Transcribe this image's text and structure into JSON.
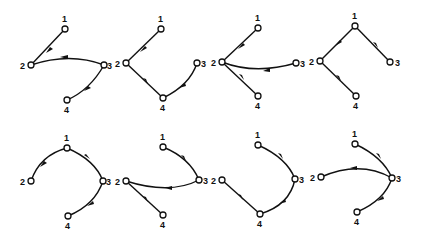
{
  "node_labels": [
    "1",
    "2",
    "3",
    "4"
  ],
  "panels": [
    {
      "id": "p1",
      "row": 1,
      "col": 1,
      "edges": [
        [
          "1",
          "2"
        ],
        [
          "3",
          "2"
        ],
        [
          "3",
          "4"
        ]
      ]
    },
    {
      "id": "p2",
      "row": 1,
      "col": 2,
      "edges": [
        [
          "1",
          "2"
        ],
        [
          "2",
          "4"
        ],
        [
          "3",
          "4"
        ]
      ]
    },
    {
      "id": "p3",
      "row": 1,
      "col": 3,
      "edges": [
        [
          "1",
          "2"
        ],
        [
          "3",
          "2"
        ],
        [
          "2",
          "4"
        ]
      ]
    },
    {
      "id": "p4",
      "row": 1,
      "col": 4,
      "edges": [
        [
          "1",
          "2"
        ],
        [
          "1",
          "3"
        ],
        [
          "2",
          "4"
        ]
      ]
    },
    {
      "id": "p5",
      "row": 2,
      "col": 1,
      "edges": [
        [
          "1",
          "2"
        ],
        [
          "1",
          "3"
        ],
        [
          "3",
          "4"
        ]
      ]
    },
    {
      "id": "p6",
      "row": 2,
      "col": 2,
      "edges": [
        [
          "1",
          "3"
        ],
        [
          "3",
          "2"
        ],
        [
          "2",
          "4"
        ]
      ]
    },
    {
      "id": "p7",
      "row": 2,
      "col": 3,
      "edges": [
        [
          "1",
          "3"
        ],
        [
          "3",
          "4"
        ],
        [
          "2",
          "4"
        ]
      ]
    },
    {
      "id": "p8",
      "row": 2,
      "col": 4,
      "edges": [
        [
          "1",
          "3"
        ],
        [
          "3",
          "2"
        ],
        [
          "3",
          "4"
        ]
      ]
    }
  ],
  "colors": {
    "stroke": "#111111",
    "background": "#ffffff"
  }
}
